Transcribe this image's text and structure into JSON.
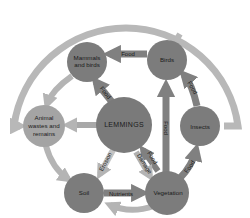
{
  "diagram": {
    "type": "food-web",
    "center": "LEMMINGS",
    "colors": {
      "node": "#7c7c7c",
      "node_light": "#a4a4a4",
      "arrow_dark": "#808080",
      "arrow_light": "#b4b4b4",
      "outer_arc": "#b8b8b8",
      "text": "#1a1a1a",
      "background": "#ffffff"
    },
    "nodes": {
      "mammals_birds": "Mammals and birds",
      "mammals_birds_line1": "Mammals",
      "mammals_birds_line2": "and birds",
      "birds": "Birds",
      "animal_wastes": "Animal wastes and remains",
      "animal_wastes_line1": "Animal",
      "animal_wastes_line2": "wastes and",
      "animal_wastes_line3": "remains",
      "lemmings": "LEMMINGS",
      "insects": "Insects",
      "soil": "Soil",
      "vegetation": "Vegetation"
    },
    "edges": [
      {
        "from": "Birds",
        "to": "Mammals and birds",
        "label": "Food"
      },
      {
        "from": "LEMMINGS",
        "to": "Mammals and birds",
        "label": "Food"
      },
      {
        "from": "Insects",
        "to": "Birds",
        "label": "Food"
      },
      {
        "from": "Vegetation",
        "to": "Birds",
        "label": "Food"
      },
      {
        "from": "Vegetation",
        "to": "Insects",
        "label": "Food"
      },
      {
        "from": "Vegetation",
        "to": "LEMMINGS",
        "label": "Food"
      },
      {
        "from": "LEMMINGS",
        "to": "Vegetation",
        "label": "Damage"
      },
      {
        "from": "LEMMINGS",
        "to": "Soil",
        "label": "Erosion"
      },
      {
        "from": "Soil",
        "to": "Vegetation",
        "label": "Nutrients"
      },
      {
        "from": "LEMMINGS",
        "to": "Animal wastes and remains",
        "label": ""
      },
      {
        "from": "Mammals and birds",
        "to": "Animal wastes and remains",
        "label": ""
      },
      {
        "from": "Animal wastes and remains",
        "to": "Soil",
        "label": ""
      },
      {
        "from": "Vegetation",
        "to": "Soil",
        "label": ""
      },
      {
        "from": "Birds",
        "to": "Animal wastes and remains",
        "label": ""
      },
      {
        "from": "Insects",
        "to": "Animal wastes and remains",
        "label": ""
      }
    ],
    "edge_labels": {
      "birds_to_mammals": "Food",
      "lemmings_to_mammals": "Food",
      "insects_to_birds": "Food",
      "veg_to_birds": "Food",
      "veg_to_insects": "Food",
      "veg_to_lemmings": "Food",
      "lemmings_to_veg": "Damage",
      "lemmings_to_soil": "Erosion",
      "soil_to_veg": "Nutrients"
    }
  }
}
